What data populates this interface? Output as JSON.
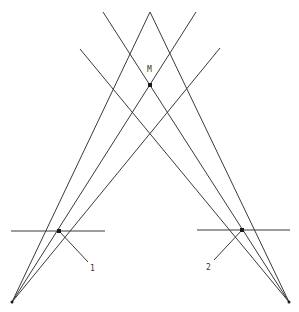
{
  "diagram": {
    "width": 299,
    "height": 312,
    "line_color": "#3a3a3a",
    "point_color": "#1a1a1a",
    "vertices": {
      "left_base": [
        12,
        302
      ],
      "right_base": [
        289,
        302
      ],
      "apex": [
        150,
        12
      ]
    },
    "lines": [
      {
        "id": "left-to-apex",
        "from": [
          12,
          302
        ],
        "to": [
          150,
          12
        ]
      },
      {
        "id": "left-to-top-right",
        "from": [
          12,
          302
        ],
        "to": [
          196,
          12
        ]
      },
      {
        "id": "left-to-outer-right",
        "from": [
          12,
          302
        ],
        "to": [
          220,
          48
        ]
      },
      {
        "id": "right-to-apex",
        "from": [
          289,
          302
        ],
        "to": [
          150,
          12
        ]
      },
      {
        "id": "right-to-top-left",
        "from": [
          289,
          302
        ],
        "to": [
          103,
          12
        ]
      },
      {
        "id": "right-to-outer-left",
        "from": [
          289,
          302
        ],
        "to": [
          80,
          49
        ]
      },
      {
        "id": "horizontal-left",
        "from": [
          11,
          231
        ],
        "to": [
          105,
          231
        ]
      },
      {
        "id": "horizontal-right",
        "from": [
          197,
          230
        ],
        "to": [
          290,
          230
        ]
      },
      {
        "id": "pointer-1",
        "from": [
          59,
          231
        ],
        "to": [
          88,
          262
        ]
      },
      {
        "id": "pointer-2",
        "from": [
          242,
          230
        ],
        "to": [
          214,
          260
        ]
      }
    ],
    "points": [
      {
        "id": "M",
        "at": [
          150,
          85
        ]
      },
      {
        "id": "P1",
        "at": [
          59,
          231
        ]
      },
      {
        "id": "P2",
        "at": [
          242,
          230
        ]
      }
    ],
    "labels": {
      "m": {
        "text": "M",
        "x": 147,
        "y": 66
      },
      "one": {
        "text": "1",
        "x": 90,
        "y": 265
      },
      "two": {
        "text": "2",
        "x": 206,
        "y": 264
      }
    }
  }
}
